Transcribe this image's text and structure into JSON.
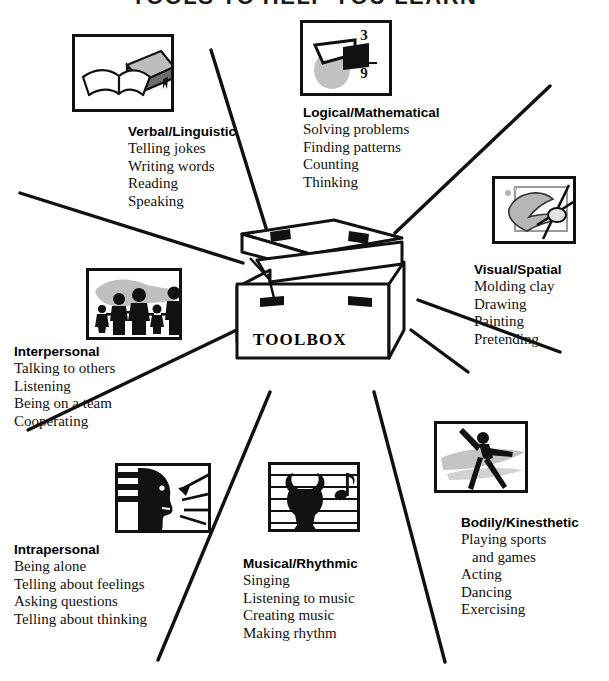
{
  "title": "TOOLS TO HELP YOU LEARN",
  "center": {
    "label": "TOOLBOX",
    "icon": "toolbox-icon"
  },
  "intelligences": [
    {
      "id": "verbal-linguistic",
      "heading": "Verbal/Linguistic",
      "items": [
        "Telling jokes",
        "Writing words",
        "Reading",
        "Speaking"
      ],
      "icon": "books-icon"
    },
    {
      "id": "logical-mathematical",
      "heading": "Logical/Mathematical",
      "items": [
        "Solving problems",
        "Finding patterns",
        "Counting",
        "Thinking"
      ],
      "icon": "arithmetic-shapes-icon",
      "icon_text": {
        "top": "3",
        "operator": "+",
        "middle": "6",
        "bottom": "9"
      }
    },
    {
      "id": "visual-spatial",
      "heading": "Visual/Spatial",
      "items": [
        "Molding clay",
        "Drawing",
        "Painting",
        "Pretending"
      ],
      "icon": "paintbrush-artwork-icon"
    },
    {
      "id": "bodily-kinesthetic",
      "heading": "Bodily/Kinesthetic",
      "items": [
        "Playing sports",
        "and games",
        "Acting",
        "Dancing",
        "Exercising"
      ],
      "icon": "dancing-figure-icon"
    },
    {
      "id": "musical-rhythmic",
      "heading": "Musical/Rhythmic",
      "items": [
        "Singing",
        "Listening to music",
        "Creating music",
        "Making rhythm"
      ],
      "icon": "lyre-music-staff-icon"
    },
    {
      "id": "intrapersonal",
      "heading": "Intrapersonal",
      "items": [
        "Being alone",
        "Telling about feelings",
        "Asking questions",
        "Telling about thinking"
      ],
      "icon": "head-profile-arrows-icon"
    },
    {
      "id": "interpersonal",
      "heading": "Interpersonal",
      "items": [
        "Talking to others",
        "Listening",
        "Being on a team",
        "Cooperating"
      ],
      "icon": "family-silhouettes-icon"
    }
  ],
  "colors": {
    "ink": "#111111",
    "paper": "#ffffff",
    "shadow": "#9a9a9a",
    "halftone": "#b8b8b8"
  }
}
